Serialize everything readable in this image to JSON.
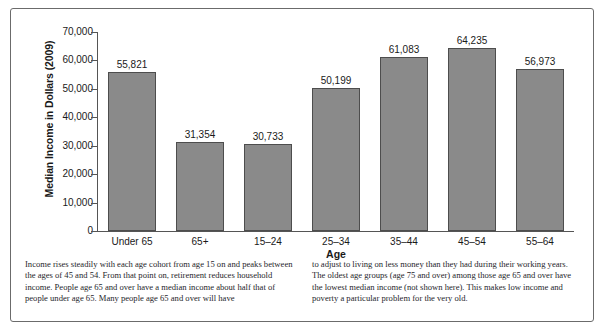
{
  "figure": {
    "caption_columns": [
      "Income rises steadily with each age cohort from age 15 on and peaks between the ages of 45 and 54. From that point on, retirement reduces household income. People age 65 and over have a median income about half that of people under age 65. Many people age 65 and over will have",
      "to adjust to living on less money than they had during their working years. The oldest age groups (age 75 and over) among those age 65 and over have the lowest median income (not shown here). This makes low income and poverty a particular problem for the very old."
    ]
  },
  "chart_data": {
    "type": "bar",
    "title": "",
    "xlabel": "Age",
    "ylabel": "Median Income in Dollars (2009)",
    "categories": [
      "Under 65",
      "65+",
      "15–24",
      "25–34",
      "35–44",
      "45–54",
      "55–64"
    ],
    "values": [
      55821,
      31354,
      30733,
      50199,
      61083,
      64235,
      56973
    ],
    "value_labels": [
      "55,821",
      "31,354",
      "30,733",
      "50,199",
      "61,083",
      "64,235",
      "56,973"
    ],
    "ylim": [
      0,
      70000
    ],
    "ytick_values": [
      70000,
      60000,
      50000,
      40000,
      30000,
      20000,
      10000,
      0
    ],
    "ytick_labels": [
      "70,000",
      "60,000",
      "50,000",
      "40,000",
      "30,000",
      "20,000",
      "10,000",
      "0"
    ],
    "grid": false,
    "legend": null,
    "bar_color": "#8a8a8a",
    "bar_edge_color": "#4d4d4d",
    "axis_color": "#555555"
  }
}
